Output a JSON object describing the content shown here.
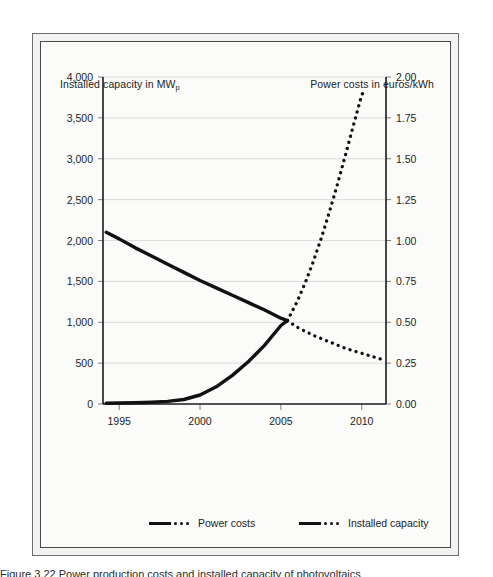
{
  "figure": {
    "left_axis_title_prefix": "Installed capacity in MW",
    "left_axis_title_subscript": "p",
    "right_axis_title": "Power costs in euros/kWh",
    "caption_partial": "Figure 3.22  Power production costs and installed capacity of photovoltaics"
  },
  "legend": {
    "items": [
      {
        "label": "Power costs",
        "swatch": "solid-then-dotted-line"
      },
      {
        "label": "Installed capacity",
        "swatch": "solid-then-dotted-line"
      }
    ]
  },
  "chart_data": {
    "type": "line",
    "title": "",
    "xlabel": "",
    "ylabel": "Installed capacity in MWp",
    "y2label": "Power costs in euros/kWh",
    "xlim": [
      1994,
      2011.5
    ],
    "ylim": [
      0,
      4000
    ],
    "y2lim": [
      0,
      2.0
    ],
    "grid": true,
    "legend_position": "bottom",
    "x_ticks": [
      1995,
      2000,
      2005,
      2010
    ],
    "x_tick_labels": [
      "1995",
      "2000",
      "2005",
      "2010"
    ],
    "y_ticks": [
      0,
      500,
      1000,
      1500,
      2000,
      2500,
      3000,
      3500,
      4000
    ],
    "y_tick_labels": [
      "0",
      "500",
      "1,000",
      "1,500",
      "2,000",
      "2,500",
      "3,000",
      "3,500",
      "4,000"
    ],
    "y2_ticks": [
      0.0,
      0.25,
      0.5,
      0.75,
      1.0,
      1.25,
      1.5,
      1.75,
      2.0
    ],
    "y2_tick_labels": [
      "0.00",
      "0.25",
      "0.50",
      "0.75",
      "1.00",
      "1.25",
      "1.50",
      "1.75",
      "2.00"
    ],
    "series": [
      {
        "name": "Power costs",
        "axis": "right",
        "style": "solid",
        "segment": "historical",
        "units": "euros/kWh",
        "x": [
          1994.2,
          1995,
          1996,
          1997,
          1998,
          1999,
          2000,
          2001,
          2002,
          2003,
          2004,
          2005,
          2005.4
        ],
        "values": [
          1.05,
          1.01,
          0.955,
          0.905,
          0.855,
          0.805,
          0.755,
          0.71,
          0.665,
          0.62,
          0.575,
          0.525,
          0.51
        ]
      },
      {
        "name": "Power costs",
        "axis": "right",
        "style": "dotted",
        "segment": "projection",
        "units": "euros/kWh",
        "x": [
          2005.4,
          2006,
          2006.5,
          2007,
          2007.5,
          2008,
          2008.5,
          2009,
          2009.5,
          2010,
          2010.5,
          2011,
          2011.3
        ],
        "values": [
          0.51,
          0.47,
          0.445,
          0.42,
          0.4,
          0.38,
          0.36,
          0.34,
          0.325,
          0.31,
          0.295,
          0.28,
          0.272
        ]
      },
      {
        "name": "Installed capacity",
        "axis": "left",
        "style": "solid",
        "segment": "historical",
        "units": "MWp",
        "x": [
          1994.2,
          1995,
          1996,
          1997,
          1998,
          1999,
          2000,
          2001,
          2002,
          2003,
          2004,
          2005,
          2005.4
        ],
        "values": [
          10,
          12,
          16,
          22,
          32,
          55,
          110,
          210,
          350,
          520,
          720,
          960,
          1020
        ]
      },
      {
        "name": "Installed capacity",
        "axis": "left",
        "style": "dotted",
        "segment": "projection",
        "units": "MWp",
        "x": [
          2005.4,
          2006,
          2006.5,
          2007,
          2007.5,
          2008,
          2008.5,
          2009,
          2009.5,
          2010,
          2010.2
        ],
        "values": [
          1020,
          1250,
          1480,
          1740,
          2030,
          2350,
          2690,
          3050,
          3420,
          3780,
          3850
        ]
      }
    ],
    "annotations": [
      {
        "text": "curves cross near 2005 at 1,000 MWp and 0.50 euros/kWh",
        "x": 2005.4,
        "y_left": 1020,
        "y_right": 0.51
      }
    ],
    "colors": {
      "series_line": "#111111",
      "gridline": "#dcdcdc",
      "axis": "#1a1a1a",
      "plot_background": "#fbfbfa",
      "frame_background": "#f2f2f0"
    }
  }
}
